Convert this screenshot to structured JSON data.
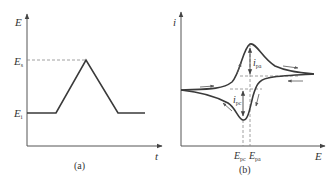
{
  "panel_a": {
    "caption": "(a)",
    "y_axis_label": "E",
    "x_axis_label": "t",
    "level_high": {
      "main": "E",
      "sub": "s"
    },
    "level_low": {
      "main": "E",
      "sub": "i"
    },
    "waveform": "triangular potential sweep",
    "points": [
      [
        27,
        113
      ],
      [
        56,
        113
      ],
      [
        86,
        60
      ],
      [
        118,
        113
      ],
      [
        145,
        113
      ]
    ]
  },
  "panel_b": {
    "caption": "(b)",
    "y_axis_label": "i",
    "x_axis_label": "E",
    "anodic_peak_current": {
      "main": "i",
      "sub": "pa"
    },
    "cathodic_peak_current": {
      "main": "i",
      "sub": "pc"
    },
    "cathodic_peak_potential": {
      "main": "E",
      "sub": "pc"
    },
    "anodic_peak_potential": {
      "main": "E",
      "sub": "pa"
    },
    "curve": "cyclic voltammogram"
  },
  "colors": {
    "line": "#3a3a3a",
    "axis": "#555555",
    "dashed": "#777777",
    "text": "#333333"
  }
}
